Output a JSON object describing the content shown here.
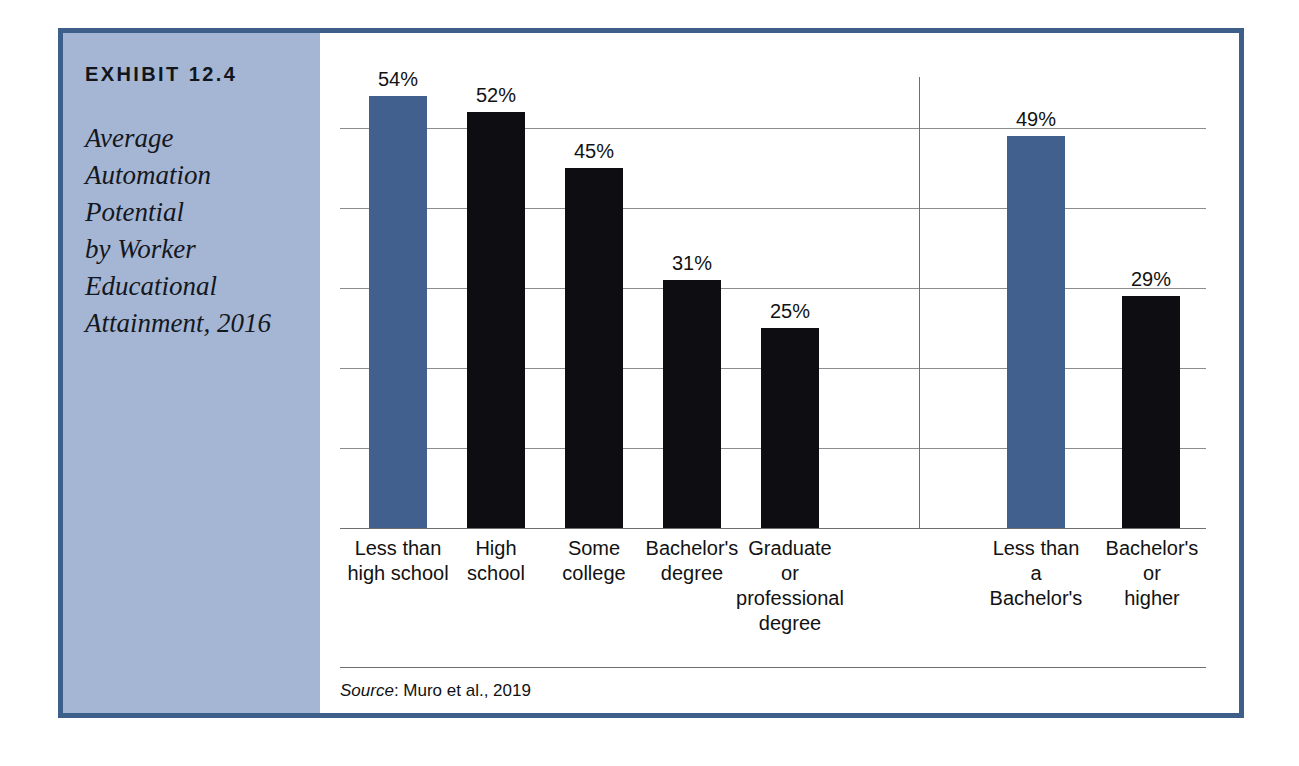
{
  "exhibit": {
    "number": "EXHIBIT 12.4",
    "title_lines": [
      "Average",
      "Automation",
      "Potential",
      "by Worker",
      "Educational",
      "Attainment, 2016"
    ],
    "panel_color": "#a5b6d4",
    "border_color": "#3e5f8a"
  },
  "source": {
    "prefix": "Source",
    "text": ": Muro et al., 2019"
  },
  "chart_data": {
    "type": "bar",
    "xlabel": "",
    "ylabel": "",
    "ylim": [
      0,
      60
    ],
    "grid": true,
    "gridline_values": [
      10,
      20,
      30,
      40,
      50
    ],
    "y_tick_labels_shown": false,
    "legend": "none",
    "value_suffix": "%",
    "colors": {
      "highlight": "#41608e",
      "standard": "#0d0d12",
      "gridline": "#8c8c8c",
      "axis": "#6f6f6f"
    },
    "groups": [
      {
        "name": "By educational attainment",
        "categories": [
          "Less than high school",
          "High school",
          "Some college",
          "Bachelor's degree",
          "Graduate or professional degree"
        ],
        "values": [
          54,
          52,
          45,
          31,
          25
        ],
        "colors": [
          "#41608e",
          "#0d0d12",
          "#0d0d12",
          "#0d0d12",
          "#0d0d12"
        ]
      },
      {
        "name": "Summary",
        "categories": [
          "Less than a Bachelor's",
          "Bachelor's or higher"
        ],
        "values": [
          49,
          29
        ],
        "colors": [
          "#41608e",
          "#0d0d12"
        ]
      }
    ],
    "bars": [
      {
        "value": 54,
        "label": "54%",
        "color": "highlight",
        "category_lines": [
          "Less than",
          "high school"
        ],
        "x": 29,
        "w": 58,
        "label_cx": 58,
        "cat_left": -8,
        "cat_w": 132
      },
      {
        "value": 52,
        "label": "52%",
        "color": "standard",
        "category_lines": [
          "High",
          "school"
        ],
        "x": 127,
        "w": 58,
        "label_cx": 156,
        "cat_left": 96,
        "cat_w": 120
      },
      {
        "value": 45,
        "label": "45%",
        "color": "standard",
        "category_lines": [
          "Some",
          "college"
        ],
        "x": 225,
        "w": 58,
        "label_cx": 254,
        "cat_left": 194,
        "cat_w": 120
      },
      {
        "value": 31,
        "label": "31%",
        "color": "standard",
        "category_lines": [
          "Bachelor's",
          "degree"
        ],
        "x": 323,
        "w": 58,
        "label_cx": 352,
        "cat_left": 290,
        "cat_w": 124
      },
      {
        "value": 25,
        "label": "25%",
        "color": "standard",
        "category_lines": [
          "Graduate",
          "or",
          "professional",
          "degree"
        ],
        "x": 421,
        "w": 58,
        "label_cx": 450,
        "cat_left": 386,
        "cat_w": 128
      },
      {
        "value": 49,
        "label": "49%",
        "color": "highlight",
        "category_lines": [
          "Less than",
          "a",
          "Bachelor's"
        ],
        "x": 667,
        "w": 58,
        "label_cx": 696,
        "cat_left": 634,
        "cat_w": 124
      },
      {
        "value": 29,
        "label": "29%",
        "color": "standard",
        "category_lines": [
          "Bachelor's",
          "or",
          "higher"
        ],
        "x": 782,
        "w": 58,
        "label_cx": 811,
        "cat_left": 753,
        "cat_w": 118
      }
    ],
    "divider_x": 579,
    "divider_top": 44
  }
}
